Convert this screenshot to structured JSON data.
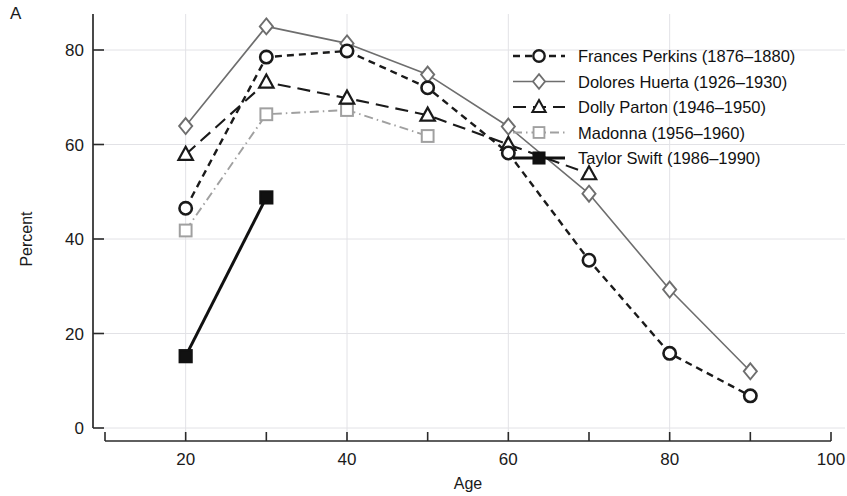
{
  "panel": {
    "label": "A"
  },
  "chart_data": {
    "type": "line",
    "title": "",
    "xlabel": "Age",
    "ylabel": "Percent",
    "xlim": [
      10,
      100
    ],
    "ylim": [
      0,
      88
    ],
    "xticks": [
      20,
      40,
      60,
      80,
      100
    ],
    "xminorticks": [
      10,
      30,
      50,
      70,
      90
    ],
    "yticks": [
      0,
      20,
      40,
      60,
      80
    ],
    "grid": true,
    "legend_position": "top-right",
    "series": [
      {
        "name": "Frances Perkins (1876–1880)",
        "marker": "circle-open",
        "linestyle": "dashed",
        "color": "#1a1a1a",
        "x": [
          20,
          30,
          40,
          50,
          60,
          70,
          80,
          90
        ],
        "values": [
          46.5,
          78.5,
          79.8,
          72.0,
          58.2,
          35.5,
          15.8,
          6.8
        ]
      },
      {
        "name": "Dolores Huerta (1926–1930)",
        "marker": "diamond-open",
        "linestyle": "solid",
        "color": "#6e6e6e",
        "x": [
          20,
          30,
          40,
          50,
          60,
          70,
          80,
          90
        ],
        "values": [
          63.9,
          85.0,
          81.4,
          74.8,
          63.8,
          49.6,
          29.3,
          12.0
        ]
      },
      {
        "name": "Dolly Parton (1946–1950)",
        "marker": "triangle-open",
        "linestyle": "long-dashed",
        "color": "#1a1a1a",
        "x": [
          20,
          30,
          40,
          50,
          60,
          70
        ],
        "values": [
          57.9,
          73.2,
          69.8,
          66.2,
          60.0,
          53.8
        ]
      },
      {
        "name": "Madonna (1956–1960)",
        "marker": "square-open",
        "linestyle": "dash-dot",
        "color": "#a0a0a0",
        "x": [
          20,
          30,
          40,
          50
        ],
        "values": [
          41.8,
          66.4,
          67.3,
          61.8
        ]
      },
      {
        "name": "Taylor Swift (1986–1990)",
        "marker": "square-filled",
        "linestyle": "solid-thick",
        "color": "#111111",
        "x": [
          20,
          30
        ],
        "values": [
          15.2,
          48.8
        ]
      }
    ]
  }
}
